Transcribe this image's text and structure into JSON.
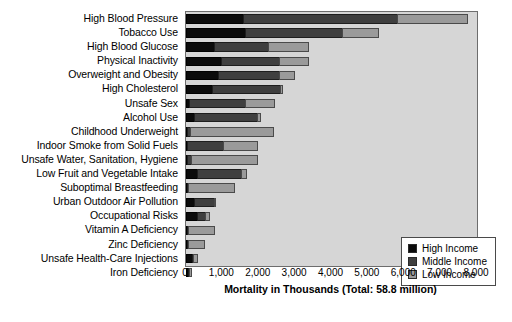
{
  "chart_data": {
    "type": "bar",
    "orientation": "horizontal",
    "stacked": true,
    "title": "",
    "xlabel": "Mortality in Thousands (Total: 58.8 million)",
    "ylabel": "",
    "xlim": [
      0,
      8000
    ],
    "xticks": [
      0,
      1000,
      2000,
      3000,
      4000,
      5000,
      6000,
      7000,
      8000
    ],
    "xtick_labels": [
      "0",
      "1,000",
      "2,000",
      "3,000",
      "4,000",
      "5,000",
      "6,000",
      "7,000",
      "8,000"
    ],
    "grid": false,
    "legend_position": "lower-right",
    "categories": [
      "High Blood Pressure",
      "Tobacco Use",
      "High Blood Glucose",
      "Physical Inactivity",
      "Overweight and Obesity",
      "High Cholesterol",
      "Unsafe Sex",
      "Alcohol Use",
      "Childhood Underweight",
      "Indoor Smoke from Solid Fuels",
      "Unsafe Water, Sanitation, Hygiene",
      "Low Fruit and Vegetable Intake",
      "Suboptimal Breastfeeding",
      "Urban Outdoor Air Pollution",
      "Occupational Risks",
      "Vitamin A Deficiency",
      "Zinc Deficiency",
      "Unsafe Health-Care Injections",
      "Iron Deficiency"
    ],
    "series": [
      {
        "name": "High Income",
        "color": "#0b0b0b",
        "values": [
          1600,
          1650,
          800,
          1000,
          900,
          750,
          120,
          250,
          20,
          60,
          50,
          320,
          60,
          260,
          330,
          15,
          15,
          200,
          90
        ]
      },
      {
        "name": "Middle Income",
        "color": "#3f3f3f",
        "values": [
          4250,
          2700,
          1500,
          1600,
          1700,
          1900,
          1550,
          1750,
          120,
          1000,
          130,
          1250,
          40,
          570,
          250,
          35,
          20,
          30,
          30
        ]
      },
      {
        "name": "Low Income",
        "color": "#9a9a9a",
        "values": [
          1950,
          1000,
          1150,
          850,
          450,
          60,
          840,
          120,
          2290,
          970,
          1850,
          170,
          1290,
          20,
          130,
          735,
          460,
          130,
          70
        ]
      }
    ],
    "totals": [
      7800,
      5350,
      3450,
      3450,
      3050,
      2710,
      2510,
      2120,
      2430,
      2030,
      2030,
      1740,
      1390,
      850,
      710,
      785,
      495,
      360,
      190
    ]
  },
  "legend": {
    "items": [
      {
        "label": "High Income",
        "swatch": "s0"
      },
      {
        "label": "Middle Income",
        "swatch": "s1"
      },
      {
        "label": "Low Income",
        "swatch": "s2"
      }
    ]
  }
}
